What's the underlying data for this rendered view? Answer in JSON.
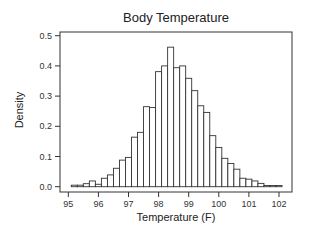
{
  "chart_data": {
    "type": "bar",
    "title": "Body Temperature",
    "xlabel": "Temperature (F)",
    "ylabel": "Density",
    "xlim": [
      94.9,
      102.5
    ],
    "ylim": [
      0.0,
      0.5
    ],
    "grid": false,
    "legend": null,
    "x_ticks": [
      95,
      96,
      97,
      98,
      99,
      100,
      101,
      102
    ],
    "y_ticks": [
      0.0,
      0.1,
      0.2,
      0.3,
      0.4,
      0.5
    ],
    "y_tick_labels": [
      "0.0",
      "0.1",
      "0.2",
      "0.3",
      "0.4",
      "0.5"
    ],
    "bin_width": 0.2,
    "bin_start": 95.1,
    "bins": [
      95.1,
      95.3,
      95.5,
      95.7,
      95.9,
      96.1,
      96.3,
      96.5,
      96.7,
      96.9,
      97.1,
      97.3,
      97.5,
      97.7,
      97.9,
      98.1,
      98.3,
      98.5,
      98.7,
      98.9,
      99.1,
      99.3,
      99.5,
      99.7,
      99.9,
      100.1,
      100.3,
      100.5,
      100.7,
      100.9,
      101.1,
      101.3,
      101.5,
      101.7,
      101.9
    ],
    "values": [
      0.005,
      0.005,
      0.01,
      0.019,
      0.008,
      0.028,
      0.039,
      0.061,
      0.088,
      0.097,
      0.164,
      0.18,
      0.265,
      0.262,
      0.381,
      0.4,
      0.462,
      0.394,
      0.4,
      0.359,
      0.318,
      0.268,
      0.246,
      0.169,
      0.13,
      0.094,
      0.077,
      0.058,
      0.028,
      0.025,
      0.019,
      0.011,
      0.004,
      0.004,
      0.004
    ]
  },
  "layout": {
    "plot_left": 60,
    "plot_right": 292,
    "plot_top": 32,
    "plot_bottom": 192,
    "y0_px": 186.7,
    "y_px_per_unit": 302,
    "x95_px": 68.3,
    "x_px_per_unit": 30.1
  }
}
